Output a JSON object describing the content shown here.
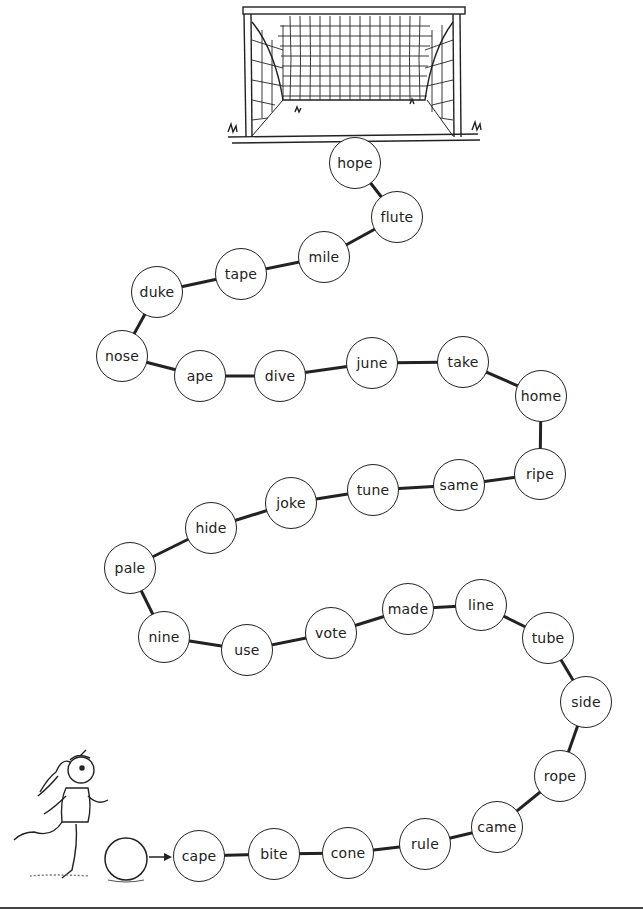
{
  "worksheet": {
    "title": "",
    "start_label": "cape",
    "end_label": "hope",
    "path": [
      {
        "word": "cape",
        "x": 199,
        "y": 856
      },
      {
        "word": "bite",
        "x": 274,
        "y": 854
      },
      {
        "word": "cone",
        "x": 348,
        "y": 853
      },
      {
        "word": "rule",
        "x": 425,
        "y": 844
      },
      {
        "word": "came",
        "x": 497,
        "y": 827
      },
      {
        "word": "rope",
        "x": 560,
        "y": 776
      },
      {
        "word": "side",
        "x": 586,
        "y": 702
      },
      {
        "word": "tube",
        "x": 548,
        "y": 638
      },
      {
        "word": "line",
        "x": 481,
        "y": 605
      },
      {
        "word": "made",
        "x": 408,
        "y": 609
      },
      {
        "word": "vote",
        "x": 331,
        "y": 633
      },
      {
        "word": "use",
        "x": 247,
        "y": 650
      },
      {
        "word": "nine",
        "x": 164,
        "y": 637
      },
      {
        "word": "pale",
        "x": 130,
        "y": 568
      },
      {
        "word": "hide",
        "x": 211,
        "y": 528
      },
      {
        "word": "joke",
        "x": 291,
        "y": 503
      },
      {
        "word": "tune",
        "x": 373,
        "y": 490
      },
      {
        "word": "same",
        "x": 459,
        "y": 485
      },
      {
        "word": "ripe",
        "x": 540,
        "y": 474
      },
      {
        "word": "home",
        "x": 541,
        "y": 396
      },
      {
        "word": "take",
        "x": 463,
        "y": 362
      },
      {
        "word": "june",
        "x": 372,
        "y": 363
      },
      {
        "word": "dive",
        "x": 280,
        "y": 376
      },
      {
        "word": "ape",
        "x": 200,
        "y": 376
      },
      {
        "word": "nose",
        "x": 122,
        "y": 356
      },
      {
        "word": "duke",
        "x": 157,
        "y": 292
      },
      {
        "word": "tape",
        "x": 241,
        "y": 274
      },
      {
        "word": "mile",
        "x": 324,
        "y": 257
      },
      {
        "word": "flute",
        "x": 397,
        "y": 217
      },
      {
        "word": "hope",
        "x": 355,
        "y": 163
      }
    ],
    "illustrations": {
      "goal": "soccer-goal",
      "player": "girl-running",
      "ball": "soccer-ball"
    },
    "colors": {
      "ink": "#222222",
      "background": "#ffffff"
    }
  }
}
